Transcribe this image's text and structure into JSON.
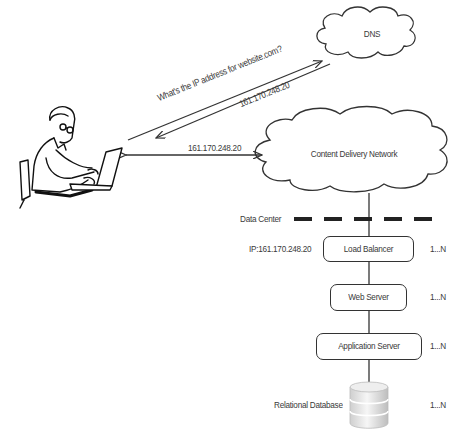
{
  "diagram": {
    "dns": {
      "label": "DNS"
    },
    "cdn": {
      "label": "Content Delivery Network"
    },
    "query_label": "What's the IP address for website.com?",
    "dns_response_label": "161.170.248.20",
    "cdn_link_label": "161.170.248.20",
    "data_center": {
      "label": "Data Center"
    },
    "ip_label": "IP:161.170.248.20",
    "tiers": [
      {
        "label": "Load Balancer",
        "multiplicity": "1...N"
      },
      {
        "label": "Web Server",
        "multiplicity": "1...N"
      },
      {
        "label": "Application Server",
        "multiplicity": "1...N"
      },
      {
        "label": "Relational Database",
        "multiplicity": "1...N"
      }
    ],
    "colors": {
      "stroke": "#333333",
      "text": "#3a3a3a",
      "background": "#ffffff"
    }
  }
}
